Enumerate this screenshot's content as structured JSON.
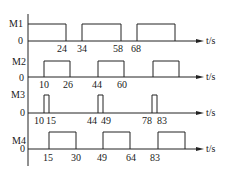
{
  "diagram": {
    "type": "timing",
    "time_unit_label": "t/s",
    "zero_label": "0",
    "signals": [
      {
        "name": "M1",
        "pulses": [
          [
            0,
            24
          ],
          [
            34,
            58
          ],
          [
            68,
            92
          ]
        ],
        "tick_labels": [
          "24",
          "34",
          "58",
          "68"
        ]
      },
      {
        "name": "M2",
        "pulses": [
          [
            10,
            26
          ],
          [
            44,
            60
          ],
          [
            78,
            94
          ]
        ],
        "tick_labels": [
          "10",
          "26",
          "44",
          "60"
        ]
      },
      {
        "name": "M3",
        "pulses": [
          [
            10,
            15
          ],
          [
            44,
            49
          ],
          [
            78,
            83
          ]
        ],
        "tick_labels": [
          "10",
          "15",
          "44",
          "49",
          "78",
          "83"
        ]
      },
      {
        "name": "M4",
        "pulses": [
          [
            15,
            30
          ],
          [
            49,
            64
          ],
          [
            83,
            98
          ]
        ],
        "tick_labels": [
          "15",
          "30",
          "49",
          "64",
          "83"
        ]
      }
    ]
  }
}
